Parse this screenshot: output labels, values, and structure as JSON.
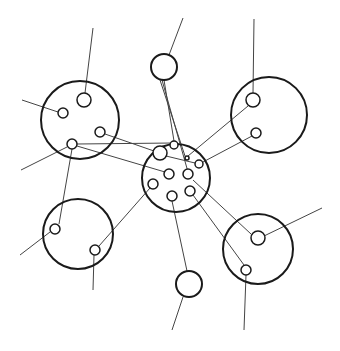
{
  "diagram": {
    "title": "",
    "stroke_color": "#1a1a1a",
    "line_color": "#444444",
    "background": "#ffffff",
    "nodes": [
      {
        "id": "top-left",
        "cx": 80,
        "cy": 120,
        "r": 39,
        "type": "big"
      },
      {
        "id": "top-right",
        "cx": 269,
        "cy": 115,
        "r": 38,
        "type": "big"
      },
      {
        "id": "center",
        "cx": 176,
        "cy": 178,
        "r": 34,
        "type": "big"
      },
      {
        "id": "bottom-left",
        "cx": 78,
        "cy": 234,
        "r": 35,
        "type": "big"
      },
      {
        "id": "bottom-right",
        "cx": 258,
        "cy": 249,
        "r": 35,
        "type": "big"
      },
      {
        "id": "top-small",
        "cx": 164,
        "cy": 67,
        "r": 13,
        "type": "big"
      },
      {
        "id": "bottom-small",
        "cx": 189,
        "cy": 284,
        "r": 13,
        "type": "big"
      }
    ]
  }
}
